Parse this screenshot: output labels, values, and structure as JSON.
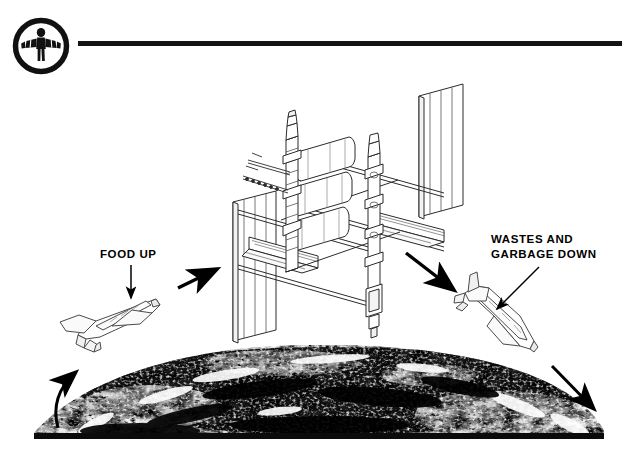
{
  "page": {
    "width": 622,
    "height": 450,
    "background": "#ffffff",
    "ink": "#000000",
    "line_color": "#141414"
  },
  "header": {
    "logo": {
      "icon": "astronaut-in-circle-logo",
      "description": "circular emblem with human figure with outstretched arms",
      "color": "#111111"
    },
    "rule": {
      "name": "header-divider-rule",
      "color": "#141414"
    }
  },
  "labels": {
    "food_up": "FOOD UP",
    "wastes_down_line1": "WASTES AND",
    "wastes_down_line2": "GARBAGE DOWN"
  },
  "diagram": {
    "title_alt": "Space station resupply logistics cycle",
    "objects": [
      {
        "name": "space-station",
        "label": "Space Station"
      },
      {
        "name": "space-shuttle-ascending",
        "label": "Space Shuttle carrying food up"
      },
      {
        "name": "space-shuttle-descending",
        "label": "Space Shuttle carrying wastes and garbage down"
      },
      {
        "name": "earth-limb",
        "label": "Earth"
      }
    ],
    "arrows": [
      {
        "name": "arrow-shuttle-to-station",
        "direction": "up-right"
      },
      {
        "name": "arrow-station-to-shuttle",
        "direction": "down-right"
      },
      {
        "name": "arrow-earth-launch",
        "direction": "up",
        "style": "curved"
      },
      {
        "name": "arrow-earth-return",
        "direction": "down-right",
        "style": "straight"
      },
      {
        "name": "leader-food-up",
        "direction": "down",
        "style": "leader-line"
      },
      {
        "name": "leader-wastes-down",
        "direction": "down-left",
        "style": "leader-line"
      }
    ]
  }
}
